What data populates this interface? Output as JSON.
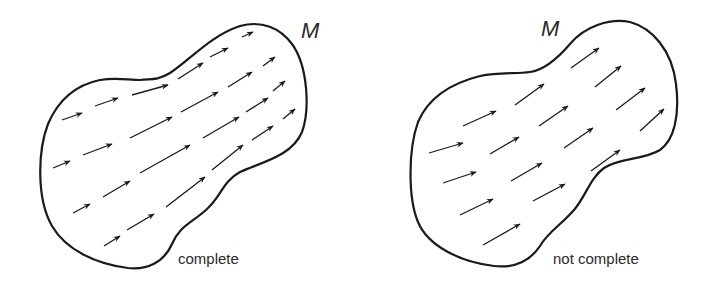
{
  "diagram": {
    "panels": [
      {
        "manifold_label": "M",
        "caption": "complete",
        "arrows": [
          [
            62,
            120,
            82,
            113
          ],
          [
            95,
            106,
            118,
            98
          ],
          [
            132,
            95,
            168,
            85
          ],
          [
            178,
            79,
            203,
            63
          ],
          [
            210,
            57,
            228,
            48
          ],
          [
            242,
            37,
            253,
            32
          ],
          [
            53,
            168,
            70,
            161
          ],
          [
            83,
            155,
            112,
            144
          ],
          [
            130,
            138,
            172,
            117
          ],
          [
            181,
            112,
            218,
            92
          ],
          [
            228,
            87,
            252,
            72
          ],
          [
            263,
            66,
            275,
            57
          ],
          [
            73,
            213,
            90,
            204
          ],
          [
            103,
            197,
            130,
            181
          ],
          [
            140,
            173,
            190,
            145
          ],
          [
            203,
            138,
            239,
            117
          ],
          [
            246,
            112,
            268,
            98
          ],
          [
            273,
            91,
            285,
            81
          ],
          [
            104,
            246,
            120,
            236
          ],
          [
            127,
            230,
            154,
            214
          ],
          [
            166,
            207,
            205,
            177
          ],
          [
            212,
            170,
            243,
            145
          ],
          [
            252,
            140,
            273,
            126
          ],
          [
            283,
            119,
            295,
            109
          ]
        ]
      },
      {
        "manifold_label": "M",
        "caption": "not complete",
        "arrows": [
          [
            429,
            153,
            463,
            143
          ],
          [
            443,
            183,
            476,
            172
          ],
          [
            460,
            215,
            493,
            199
          ],
          [
            483,
            245,
            520,
            224
          ],
          [
            463,
            126,
            496,
            111
          ],
          [
            490,
            154,
            519,
            137
          ],
          [
            511,
            181,
            542,
            163
          ],
          [
            533,
            201,
            565,
            184
          ],
          [
            515,
            105,
            544,
            84
          ],
          [
            539,
            126,
            568,
            106
          ],
          [
            564,
            148,
            593,
            128
          ],
          [
            591,
            171,
            620,
            150
          ],
          [
            571,
            68,
            599,
            48
          ],
          [
            595,
            87,
            621,
            66
          ],
          [
            616,
            110,
            645,
            88
          ],
          [
            640,
            131,
            664,
            109
          ]
        ]
      }
    ],
    "colors": {
      "stroke": "#1a1a1a",
      "text": "#2a2a2a",
      "background": "#ffffff"
    }
  }
}
